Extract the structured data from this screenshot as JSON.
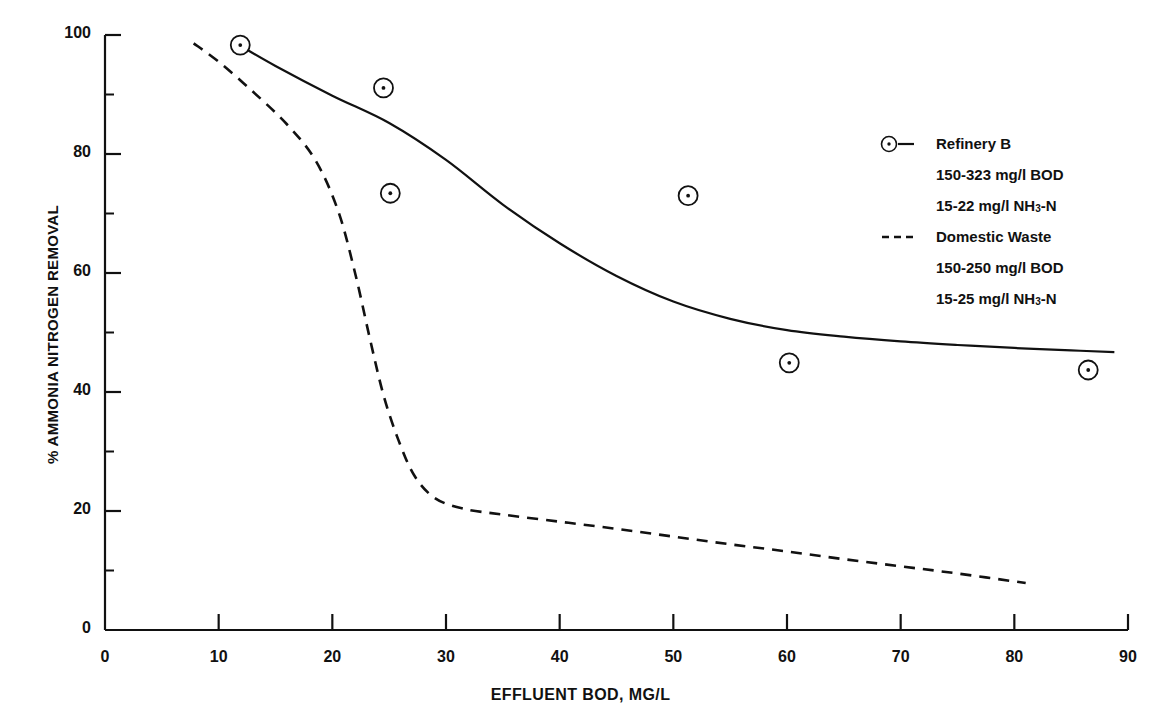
{
  "chart_data": {
    "type": "scatter",
    "title": "",
    "xlabel": "EFFLUENT BOD, MG/L",
    "ylabel": "% AMMONIA NITROGEN REMOVAL",
    "xlim": [
      0,
      90
    ],
    "ylim": [
      0,
      100
    ],
    "xticks": [
      0,
      10,
      20,
      30,
      40,
      50,
      60,
      70,
      80,
      90
    ],
    "yticks": [
      0,
      20,
      40,
      60,
      80,
      100
    ],
    "y_minor_ticks": [
      10,
      30,
      50,
      70,
      90
    ],
    "grid": false,
    "legend_position": "upper right",
    "series": [
      {
        "name": "Refinery B",
        "style": "solid",
        "marker": "circle-dot",
        "detail_lines": [
          "150-323 mg/l BOD",
          "15-22 mg/l NH3-N"
        ],
        "points": [
          {
            "x": 11.9,
            "y": 98.3
          },
          {
            "x": 24.5,
            "y": 91.1
          },
          {
            "x": 25.1,
            "y": 73.4
          },
          {
            "x": 51.3,
            "y": 73.0
          },
          {
            "x": 60.2,
            "y": 44.9
          },
          {
            "x": 86.5,
            "y": 43.7
          }
        ],
        "curve": [
          {
            "x": 11.9,
            "y": 98.2
          },
          {
            "x": 15.0,
            "y": 94.8
          },
          {
            "x": 20.0,
            "y": 89.8
          },
          {
            "x": 25.0,
            "y": 85.2
          },
          {
            "x": 30.0,
            "y": 79.0
          },
          {
            "x": 35.0,
            "y": 71.5
          },
          {
            "x": 40.0,
            "y": 65.0
          },
          {
            "x": 45.0,
            "y": 59.5
          },
          {
            "x": 50.0,
            "y": 55.2
          },
          {
            "x": 55.0,
            "y": 52.3
          },
          {
            "x": 60.0,
            "y": 50.4
          },
          {
            "x": 65.0,
            "y": 49.3
          },
          {
            "x": 70.0,
            "y": 48.5
          },
          {
            "x": 75.0,
            "y": 47.9
          },
          {
            "x": 80.0,
            "y": 47.4
          },
          {
            "x": 85.0,
            "y": 47.0
          },
          {
            "x": 88.8,
            "y": 46.7
          }
        ]
      },
      {
        "name": "Domestic Waste",
        "style": "dashed",
        "marker": "none",
        "detail_lines": [
          "150-250 mg/l BOD",
          "15-25 mg/l NH3-N"
        ],
        "points": [],
        "curve": [
          {
            "x": 7.8,
            "y": 98.6
          },
          {
            "x": 10.0,
            "y": 95.5
          },
          {
            "x": 13.0,
            "y": 90.5
          },
          {
            "x": 16.0,
            "y": 85.0
          },
          {
            "x": 18.5,
            "y": 79.0
          },
          {
            "x": 20.5,
            "y": 70.5
          },
          {
            "x": 22.0,
            "y": 60.0
          },
          {
            "x": 23.3,
            "y": 49.0
          },
          {
            "x": 24.5,
            "y": 39.5
          },
          {
            "x": 25.8,
            "y": 32.0
          },
          {
            "x": 27.2,
            "y": 26.0
          },
          {
            "x": 29.0,
            "y": 22.2
          },
          {
            "x": 31.5,
            "y": 20.4
          },
          {
            "x": 35.0,
            "y": 19.4
          },
          {
            "x": 40.0,
            "y": 18.2
          },
          {
            "x": 45.0,
            "y": 17.0
          },
          {
            "x": 50.0,
            "y": 15.7
          },
          {
            "x": 55.0,
            "y": 14.4
          },
          {
            "x": 60.0,
            "y": 13.2
          },
          {
            "x": 65.0,
            "y": 11.9
          },
          {
            "x": 70.0,
            "y": 10.7
          },
          {
            "x": 75.0,
            "y": 9.5
          },
          {
            "x": 81.0,
            "y": 7.9
          }
        ]
      }
    ]
  },
  "axes": {
    "x_title": "EFFLUENT BOD, MG/L",
    "y_title": "% AMMONIA NITROGEN REMOVAL",
    "x_tick_labels": [
      "0",
      "10",
      "20",
      "30",
      "40",
      "50",
      "60",
      "70",
      "80",
      "90"
    ],
    "y_tick_labels": [
      "0",
      "20",
      "40",
      "60",
      "80",
      "100"
    ]
  },
  "legend": {
    "entries": [
      {
        "label": "Refinery B",
        "sample": "circle-dash",
        "details": [
          "150-323 mg/l BOD",
          "15-22 mg/l NH",
          "3",
          "-N"
        ],
        "detail_bod": "150-323 mg/l BOD",
        "detail_nh_prefix": "15-22 mg/l NH",
        "detail_nh_sub": "3",
        "detail_nh_suffix": "-N"
      },
      {
        "label": "Domestic Waste",
        "sample": "dashes",
        "detail_bod": "150-250 mg/l BOD",
        "detail_nh_prefix": "15-25 mg/l NH",
        "detail_nh_sub": "3",
        "detail_nh_suffix": "-N"
      }
    ]
  },
  "colors": {
    "ink": "#111111",
    "background": "#ffffff"
  }
}
